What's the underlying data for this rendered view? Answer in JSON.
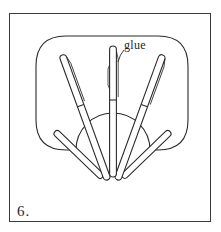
{
  "figure": {
    "step_number": "6.",
    "labels": {
      "glue": "glue"
    },
    "shapes": {
      "rounded_board": "rounded-rectangle backing",
      "half_circle": "semicircle base",
      "sticks_count": 5
    },
    "colors": {
      "stroke": "#2a2a2a",
      "background": "#ffffff"
    }
  }
}
